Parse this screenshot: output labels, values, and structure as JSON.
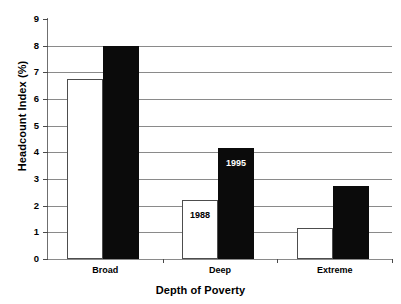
{
  "chart_data": {
    "type": "bar",
    "title": "",
    "xlabel": "Depth of Poverty",
    "ylabel": "Headcount Index (%)",
    "categories": [
      "Broad",
      "Deep",
      "Extreme"
    ],
    "series": [
      {
        "name": "1988",
        "values": [
          6.75,
          2.2,
          1.15
        ],
        "color": "#ffffff"
      },
      {
        "name": "1995",
        "values": [
          8.0,
          4.15,
          2.75
        ],
        "color": "#0b0b0b"
      }
    ],
    "ylim": [
      0,
      9
    ],
    "yticks": [
      0,
      1,
      2,
      3,
      4,
      5,
      6,
      7,
      8,
      9
    ],
    "ytick_labels": [
      "0",
      "1",
      "2",
      "3",
      "4",
      "5",
      "6",
      "7",
      "8",
      "9"
    ],
    "grid": true,
    "grid_axis": "y",
    "legend": "none",
    "annotations": [
      {
        "text": "1988",
        "category": "Deep",
        "series": "1988"
      },
      {
        "text": "1995",
        "category": "Deep",
        "series": "1995"
      }
    ]
  },
  "axes": {
    "y_title": "Headcount Index (%)",
    "x_title": "Depth of Poverty"
  }
}
